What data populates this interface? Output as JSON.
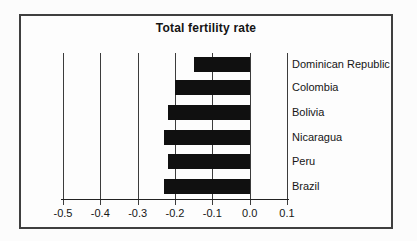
{
  "chart_data": {
    "type": "bar",
    "orientation": "horizontal",
    "title": "Total fertility rate",
    "categories": [
      "Dominican Republic",
      "Colombia",
      "Bolivia",
      "Nicaragua",
      "Peru",
      "Brazil"
    ],
    "values": [
      -0.15,
      -0.2,
      -0.22,
      -0.23,
      -0.22,
      -0.23
    ],
    "xlim": [
      -0.5,
      0.1
    ],
    "xticks": [
      -0.5,
      -0.4,
      -0.3,
      -0.2,
      -0.1,
      0.0,
      0.1
    ],
    "xtick_labels": [
      "-0.5",
      "-0.4",
      "-0.3",
      "-0.2",
      "-0.1",
      "0.0",
      "0.1"
    ],
    "grid": true,
    "legend": "none",
    "bar_color": "#101010",
    "gridline_color": "#3c3c3c",
    "frame_color": "#3f3f3f",
    "text_color": "#161616"
  }
}
